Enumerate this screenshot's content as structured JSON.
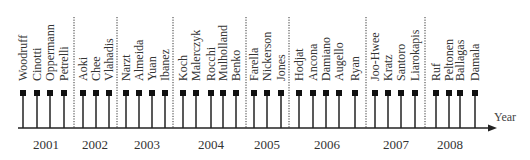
{
  "colors": {
    "line": "#222222",
    "marker": "#111111",
    "divider": "#333333",
    "text": "#333333"
  },
  "axis": {
    "title": "Year",
    "x_start": 18,
    "x_end": 497,
    "y": 128
  },
  "stem": {
    "top": 93,
    "marker_size": 6
  },
  "label_baseline_y": 81,
  "divider": {
    "top": 17,
    "bottom": 128
  },
  "dividers_x": [
    74,
    117,
    173,
    246,
    289,
    366,
    425
  ],
  "years": [
    {
      "label": "2001",
      "x": 46,
      "authors": [
        {
          "name": "Woodruff",
          "x": 23
        },
        {
          "name": "Cinotti",
          "x": 37
        },
        {
          "name": "Oppermann",
          "x": 50
        },
        {
          "name": "Petrelli",
          "x": 64
        }
      ]
    },
    {
      "label": "2002",
      "x": 95,
      "authors": [
        {
          "name": "Aoki",
          "x": 83
        },
        {
          "name": "Chee",
          "x": 96
        },
        {
          "name": "Vlahadis",
          "x": 109
        }
      ]
    },
    {
      "label": "2003",
      "x": 147,
      "authors": [
        {
          "name": "Narzt",
          "x": 126
        },
        {
          "name": "Almeida",
          "x": 139
        },
        {
          "name": "Yuan",
          "x": 152
        },
        {
          "name": "Ibanez",
          "x": 165
        }
      ]
    },
    {
      "label": "2004",
      "x": 211,
      "authors": [
        {
          "name": "Koch",
          "x": 183
        },
        {
          "name": "Malerczyk",
          "x": 196
        },
        {
          "name": "Rocchi",
          "x": 211
        },
        {
          "name": "Mulholland",
          "x": 223
        },
        {
          "name": "Benko",
          "x": 236
        }
      ]
    },
    {
      "label": "2005",
      "x": 267,
      "authors": [
        {
          "name": "Farella",
          "x": 254
        },
        {
          "name": "Nickerson",
          "x": 267
        },
        {
          "name": "Jones",
          "x": 281
        }
      ]
    },
    {
      "label": "2006",
      "x": 327,
      "authors": [
        {
          "name": "Hodjat",
          "x": 299
        },
        {
          "name": "Ancona",
          "x": 313
        },
        {
          "name": "Damiano",
          "x": 326
        },
        {
          "name": "Augello",
          "x": 339
        },
        {
          "name": "Ryan",
          "x": 355
        }
      ]
    },
    {
      "label": "2007",
      "x": 396,
      "authors": [
        {
          "name": "Joo-Hwee",
          "x": 375
        },
        {
          "name": "Kratz",
          "x": 388
        },
        {
          "name": "Santoro",
          "x": 401
        },
        {
          "name": "Liarokapis",
          "x": 415
        }
      ]
    },
    {
      "label": "2008",
      "x": 450,
      "authors": [
        {
          "name": "Ruf",
          "x": 436
        },
        {
          "name": "Peltonen",
          "x": 449
        },
        {
          "name": "Ballagas",
          "x": 460
        },
        {
          "name": "Damala",
          "x": 475
        }
      ]
    }
  ]
}
